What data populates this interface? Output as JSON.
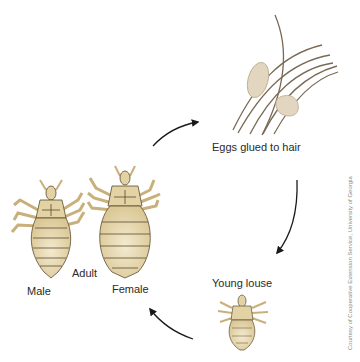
{
  "diagram": {
    "stages": [
      {
        "id": "eggs",
        "label": "Eggs glued to hair"
      },
      {
        "id": "young",
        "label": "Young louse"
      },
      {
        "id": "adult",
        "label": "Adult",
        "sub_labels": [
          "Male",
          "Female"
        ]
      }
    ],
    "cycle_order": [
      "Adult",
      "Eggs glued to hair",
      "Young louse",
      "Adult"
    ],
    "credit": "Courtesy of Cooperative Extension Service, University of Georgia",
    "colors": {
      "louse_body": "#e2d2a4",
      "louse_outline": "#5a4a30",
      "egg": "#e3d6c0",
      "hair": "#7a6a55",
      "arrow": "#1a1a1a",
      "background": "#ffffff"
    }
  }
}
